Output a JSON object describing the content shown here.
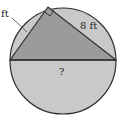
{
  "diagram": {
    "type": "circle-inscribed-right-triangle",
    "labels": {
      "left_side": "ft",
      "right_side": "8 ft",
      "diameter": "?"
    },
    "colors": {
      "background": "#ffffff",
      "circle_fill": "#c9c9c9",
      "triangle_fill": "#9b9b9b",
      "stroke": "#2e2e2e"
    }
  }
}
